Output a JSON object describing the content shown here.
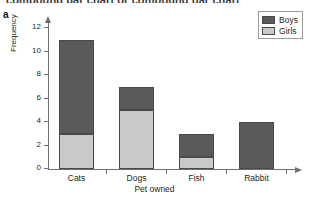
{
  "figure": {
    "top_heading": "compound bar chart or compound bar chart",
    "panel_letter": "a"
  },
  "legend": {
    "position": "top-right",
    "entries": [
      {
        "label": "Boys",
        "color": "#5a5a5a"
      },
      {
        "label": "Girls",
        "color": "#c9c9c9"
      }
    ]
  },
  "axes": {
    "x_title": "Pet owned",
    "y_title": "Frequency",
    "y_ticks": [
      "0",
      "2",
      "4",
      "6",
      "8",
      "10",
      "12"
    ]
  },
  "chart_data": {
    "type": "bar",
    "title": "",
    "subtitle": "",
    "xlabel": "Pet owned",
    "ylabel": "Frequency",
    "categories": [
      "Cats",
      "Dogs",
      "Fish",
      "Rabbit"
    ],
    "stacked": true,
    "series": [
      {
        "name": "Girls",
        "color": "#c9c9c9",
        "values": [
          3,
          5,
          1,
          0
        ]
      },
      {
        "name": "Boys",
        "color": "#5a5a5a",
        "values": [
          8,
          2,
          2,
          4
        ]
      }
    ],
    "totals": [
      11,
      7,
      3,
      4
    ],
    "ylim": [
      0,
      12.6
    ],
    "yticks": [
      0,
      2,
      4,
      6,
      8,
      10,
      12
    ],
    "grid": false,
    "legend_entries": [
      "Boys",
      "Girls"
    ],
    "legend_position": "top-right"
  }
}
